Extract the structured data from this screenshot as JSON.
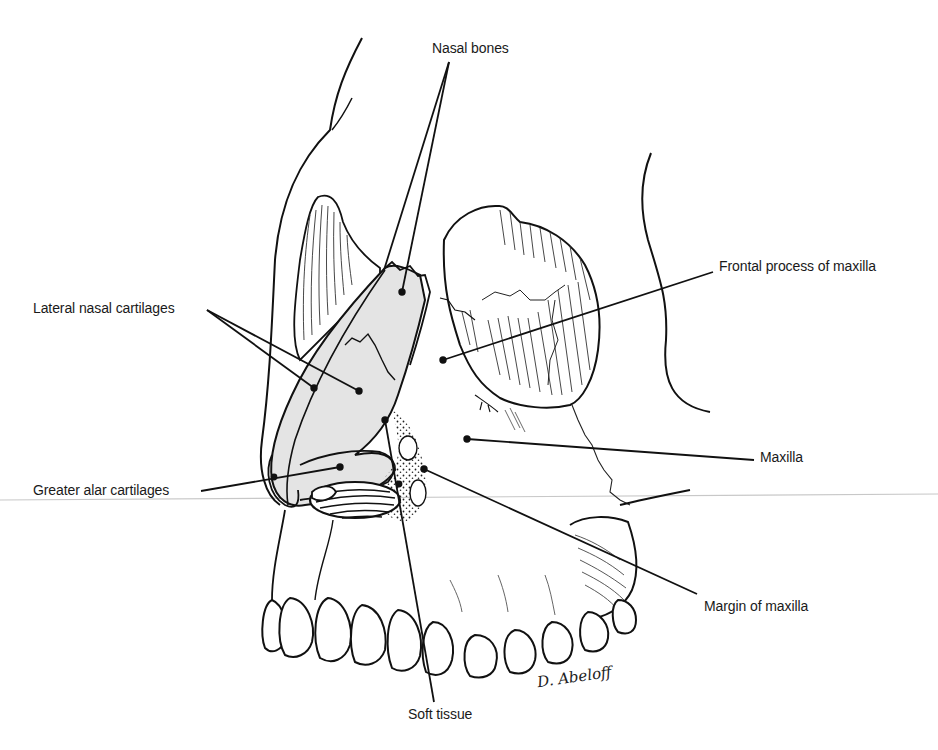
{
  "figure": {
    "colors": {
      "ink": "#111111",
      "cartilage_fill": "#e4e4e4",
      "background": "#ffffff",
      "scan_line": "#c8c8c8"
    },
    "signature": "D. Abeloff"
  },
  "labels": [
    {
      "id": "nasal-bones",
      "text": "Nasal bones",
      "x": 432,
      "y": 40
    },
    {
      "id": "frontal-process-of-maxilla",
      "text": "Frontal process of maxilla",
      "x": 719,
      "y": 258
    },
    {
      "id": "lateral-nasal-cartilages",
      "text": "Lateral nasal cartilages",
      "x": 33,
      "y": 300
    },
    {
      "id": "maxilla",
      "text": "Maxilla",
      "x": 760,
      "y": 449
    },
    {
      "id": "greater-alar-cartilages",
      "text": "Greater alar cartilages",
      "x": 33,
      "y": 482
    },
    {
      "id": "margin-of-maxilla",
      "text": "Margin of maxilla",
      "x": 704,
      "y": 598
    },
    {
      "id": "soft-tissue",
      "text": "Soft tissue",
      "x": 408,
      "y": 706
    }
  ],
  "leaders": [
    {
      "label": "nasal-bones",
      "from": [
        449,
        62
      ],
      "to": [
        [
          384,
          270
        ],
        [
          402,
          292
        ]
      ]
    },
    {
      "label": "frontal-process-of-maxilla",
      "from": [
        713,
        272
      ],
      "to": [
        [
          443,
          360
        ]
      ]
    },
    {
      "label": "lateral-nasal-cartilages",
      "from": [
        207,
        310
      ],
      "to": [
        [
          314,
          388
        ],
        [
          359,
          391
        ]
      ]
    },
    {
      "label": "maxilla",
      "from": [
        754,
        460
      ],
      "to": [
        [
          467,
          439
        ]
      ]
    },
    {
      "label": "greater-alar-cartilages",
      "from": [
        201,
        491
      ],
      "to": [
        [
          340,
          467
        ]
      ]
    },
    {
      "label": "margin-of-maxilla",
      "from": [
        697,
        594
      ],
      "to": [
        [
          424,
          469
        ]
      ]
    },
    {
      "label": "soft-tissue",
      "from": [
        434,
        702
      ],
      "to": [
        [
          385,
          420
        ]
      ]
    }
  ]
}
